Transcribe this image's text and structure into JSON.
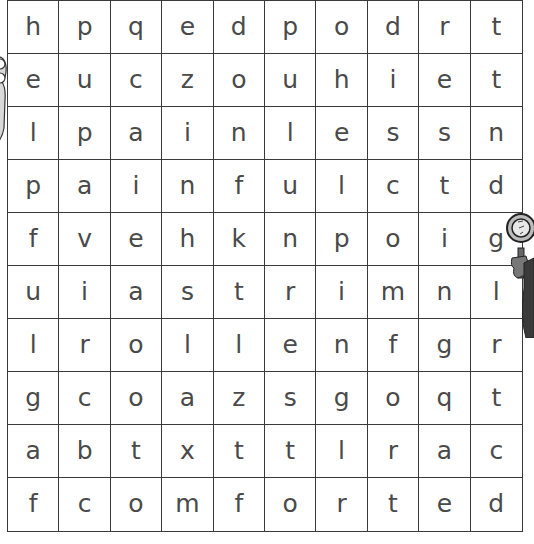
{
  "puzzle": {
    "type": "word-search",
    "rows": 10,
    "cols": 10,
    "grid": [
      [
        "h",
        "p",
        "q",
        "e",
        "d",
        "p",
        "o",
        "d",
        "r",
        "t"
      ],
      [
        "e",
        "u",
        "c",
        "z",
        "o",
        "u",
        "h",
        "i",
        "e",
        "t"
      ],
      [
        "l",
        "p",
        "a",
        "i",
        "n",
        "l",
        "e",
        "s",
        "s",
        "n"
      ],
      [
        "p",
        "a",
        "i",
        "n",
        "f",
        "u",
        "l",
        "c",
        "t",
        "d"
      ],
      [
        "f",
        "v",
        "e",
        "h",
        "k",
        "n",
        "p",
        "o",
        "i",
        "g"
      ],
      [
        "u",
        "i",
        "a",
        "s",
        "t",
        "r",
        "i",
        "m",
        "n",
        "l"
      ],
      [
        "l",
        "r",
        "o",
        "l",
        "l",
        "e",
        "n",
        "f",
        "g",
        "r"
      ],
      [
        "g",
        "c",
        "o",
        "a",
        "z",
        "s",
        "g",
        "o",
        "q",
        "t"
      ],
      [
        "a",
        "b",
        "t",
        "x",
        "t",
        "t",
        "l",
        "r",
        "a",
        "c"
      ],
      [
        "f",
        "c",
        "o",
        "m",
        "f",
        "o",
        "r",
        "t",
        "e",
        "d"
      ]
    ]
  },
  "decorations": {
    "left": "cartoon-character-peeking",
    "right": "detective-with-magnifying-glass"
  },
  "colors": {
    "grid_line": "#3a3a3a",
    "letter": "#4a4a4a",
    "background": "#ffffff"
  }
}
